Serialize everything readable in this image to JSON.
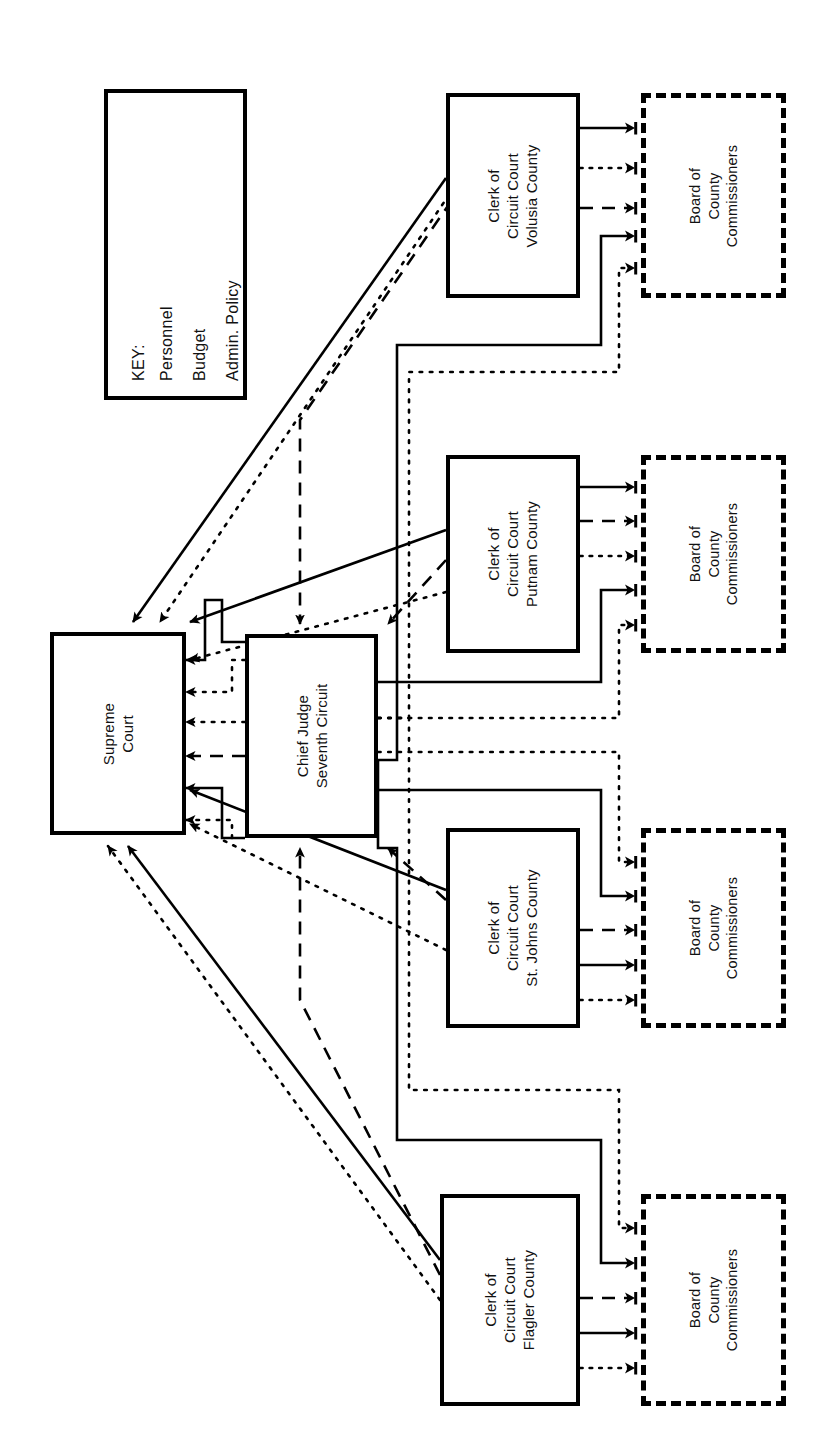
{
  "diagram": {
    "orientation": "rotated-90-ccw",
    "colors": {
      "line": "#000000",
      "text": "#111111",
      "background": "#ffffff"
    }
  },
  "key": {
    "heading": "KEY:",
    "entries": [
      {
        "label": "Personnel",
        "style": "solid"
      },
      {
        "label": "Budget",
        "style": "dotted"
      },
      {
        "label": "Admin. Policy",
        "style": "dashed"
      }
    ]
  },
  "nodes": {
    "supreme_court": {
      "lines": [
        "Supreme",
        "Court"
      ],
      "border": "solid"
    },
    "chief_judge": {
      "lines": [
        "Chief Judge",
        "Seventh Circuit"
      ],
      "border": "solid"
    },
    "clerk_volusia": {
      "lines": [
        "Clerk of",
        "Circuit Court",
        "Volusia County"
      ],
      "border": "solid"
    },
    "clerk_putnam": {
      "lines": [
        "Clerk of",
        "Circuit Court",
        "Putnam County"
      ],
      "border": "solid"
    },
    "clerk_stjohns": {
      "lines": [
        "Clerk of",
        "Circuit Court",
        "St. Johns County"
      ],
      "border": "solid"
    },
    "clerk_flagler": {
      "lines": [
        "Clerk of",
        "Circuit Court",
        "Flagler County"
      ],
      "border": "solid"
    },
    "board_volusia": {
      "lines": [
        "Board of",
        "County",
        "Commissioners"
      ],
      "border": "dashed"
    },
    "board_putnam": {
      "lines": [
        "Board of",
        "County",
        "Commissioners"
      ],
      "border": "dashed"
    },
    "board_stjohns": {
      "lines": [
        "Board of",
        "County",
        "Commissioners"
      ],
      "border": "dashed"
    },
    "board_flagler": {
      "lines": [
        "Board of",
        "County",
        "Commissioners"
      ],
      "border": "dashed"
    }
  },
  "edges": [
    {
      "from": "clerk_volusia",
      "to": "board_volusia",
      "style": "solid"
    },
    {
      "from": "clerk_volusia",
      "to": "board_volusia",
      "style": "dotted"
    },
    {
      "from": "clerk_volusia",
      "to": "board_volusia",
      "style": "dashed"
    },
    {
      "from": "chief_judge",
      "to": "board_volusia",
      "style": "solid"
    },
    {
      "from": "chief_judge",
      "to": "board_volusia",
      "style": "dotted"
    },
    {
      "from": "clerk_putnam",
      "to": "board_putnam",
      "style": "solid"
    },
    {
      "from": "clerk_putnam",
      "to": "board_putnam",
      "style": "dashed"
    },
    {
      "from": "clerk_putnam",
      "to": "board_putnam",
      "style": "dotted"
    },
    {
      "from": "chief_judge",
      "to": "board_putnam",
      "style": "solid"
    },
    {
      "from": "chief_judge",
      "to": "board_putnam",
      "style": "dotted"
    },
    {
      "from": "chief_judge",
      "to": "board_stjohns",
      "style": "dotted"
    },
    {
      "from": "chief_judge",
      "to": "board_stjohns",
      "style": "solid"
    },
    {
      "from": "clerk_stjohns",
      "to": "board_stjohns",
      "style": "dashed"
    },
    {
      "from": "clerk_stjohns",
      "to": "board_stjohns",
      "style": "solid"
    },
    {
      "from": "clerk_stjohns",
      "to": "board_stjohns",
      "style": "dotted"
    },
    {
      "from": "chief_judge",
      "to": "board_flagler",
      "style": "dotted"
    },
    {
      "from": "chief_judge",
      "to": "board_flagler",
      "style": "solid"
    },
    {
      "from": "clerk_flagler",
      "to": "board_flagler",
      "style": "dashed"
    },
    {
      "from": "clerk_flagler",
      "to": "board_flagler",
      "style": "solid"
    },
    {
      "from": "clerk_flagler",
      "to": "board_flagler",
      "style": "dotted"
    },
    {
      "from": "clerk_volusia",
      "to": "supreme_court",
      "style": "solid"
    },
    {
      "from": "clerk_volusia",
      "to": "supreme_court",
      "style": "dotted"
    },
    {
      "from": "clerk_volusia",
      "to": "chief_judge",
      "style": "dashed"
    },
    {
      "from": "clerk_putnam",
      "to": "supreme_court",
      "style": "solid"
    },
    {
      "from": "clerk_putnam",
      "to": "supreme_court",
      "style": "dotted"
    },
    {
      "from": "clerk_putnam",
      "to": "chief_judge",
      "style": "dashed"
    },
    {
      "from": "clerk_stjohns",
      "to": "supreme_court",
      "style": "solid"
    },
    {
      "from": "clerk_stjohns",
      "to": "supreme_court",
      "style": "dotted"
    },
    {
      "from": "clerk_stjohns",
      "to": "chief_judge",
      "style": "dashed"
    },
    {
      "from": "clerk_flagler",
      "to": "supreme_court",
      "style": "solid"
    },
    {
      "from": "clerk_flagler",
      "to": "supreme_court",
      "style": "dotted"
    },
    {
      "from": "clerk_flagler",
      "to": "chief_judge",
      "style": "dashed"
    },
    {
      "from": "chief_judge",
      "to": "supreme_court",
      "style": "solid"
    },
    {
      "from": "chief_judge",
      "to": "supreme_court",
      "style": "dotted"
    },
    {
      "from": "chief_judge",
      "to": "supreme_court",
      "style": "dotted"
    },
    {
      "from": "chief_judge",
      "to": "supreme_court",
      "style": "dashed"
    }
  ]
}
